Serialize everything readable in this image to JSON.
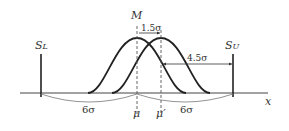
{
  "diagram": {
    "type": "process-capability-shift",
    "labels": {
      "mean_marker": "M",
      "lower_spec": "S",
      "lower_spec_sub": "L",
      "upper_spec": "S",
      "upper_spec_sub": "U",
      "x_axis": "x",
      "mu": "μ",
      "mu_shifted": "μ′",
      "shift": "1.5σ",
      "upper_gap": "4.5σ",
      "left_span": "6σ",
      "right_span": "6σ"
    },
    "colors": {
      "curve": "#222222",
      "axis": "#333333",
      "dim": "#666666"
    }
  }
}
